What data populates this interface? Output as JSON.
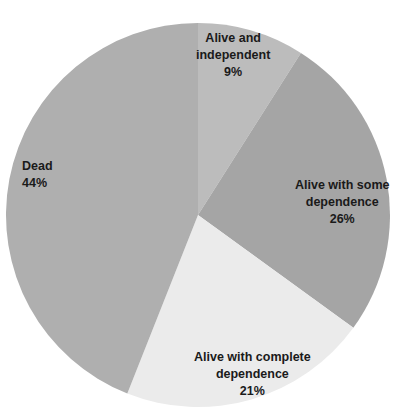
{
  "chart_data": {
    "type": "pie",
    "title": "",
    "start_angle_deg": 0,
    "direction": "clockwise",
    "slices": [
      {
        "label": "Alive and independent",
        "value": 9,
        "display": "9%",
        "color": "#bcbcbc"
      },
      {
        "label": "Alive with some dependence",
        "value": 26,
        "display": "26%",
        "color": "#a5a5a5"
      },
      {
        "label": "Alive with complete dependence",
        "value": 21,
        "display": "21%",
        "color": "#ebebeb"
      },
      {
        "label": "Dead",
        "value": 44,
        "display": "44%",
        "color": "#afafaf"
      }
    ],
    "legend": "none",
    "data_labels": "inside"
  },
  "labels": {
    "independent": {
      "line1": "Alive and",
      "line2": "independent",
      "pct": "9%"
    },
    "some": {
      "line1": "Alive with some",
      "line2": "dependence",
      "pct": "26%"
    },
    "complete": {
      "line1": "Alive with complete",
      "line2": "dependence",
      "pct": "21%"
    },
    "dead": {
      "line1": "Dead",
      "pct": "44%"
    }
  }
}
